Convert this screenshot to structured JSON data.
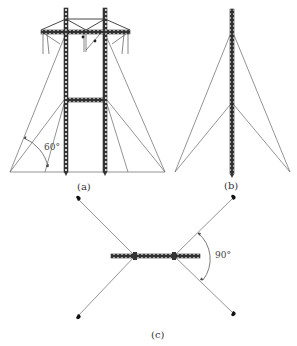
{
  "figure": {
    "panels": [
      {
        "id": "a",
        "label": "(a)",
        "description": "Guyed portal (two-mast) transmission tower, front view",
        "angle_label": "60°"
      },
      {
        "id": "b",
        "label": "(b)",
        "description": "Single-mast guyed tower, side view"
      },
      {
        "id": "c",
        "label": "(c)",
        "description": "Plan view of guy wire layout",
        "angle_label": "90°"
      }
    ]
  },
  "colors": {
    "line": "#555555",
    "member": "#333333",
    "background": "#ffffff"
  }
}
